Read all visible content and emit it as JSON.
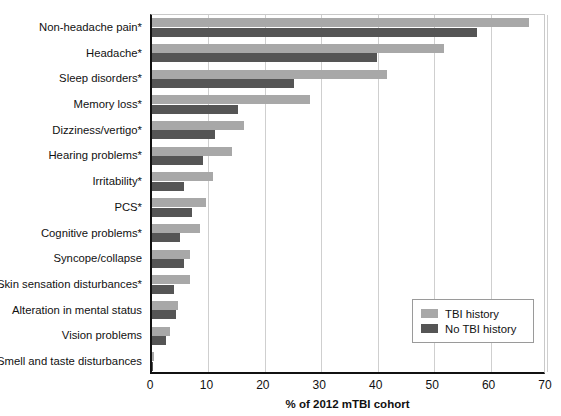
{
  "chart_data": {
    "type": "bar",
    "orientation": "horizontal",
    "title": "",
    "subtitle": "",
    "xlabel": "% of 2012 mTBI cohort",
    "ylabel": "",
    "xlim": [
      0,
      70
    ],
    "xticks": [
      0,
      10,
      20,
      30,
      40,
      50,
      60,
      70
    ],
    "grid": "vertical",
    "legend_position": "inside-bottom-right",
    "categories": [
      "Non-headache pain*",
      "Headache*",
      "Sleep disorders*",
      "Memory loss*",
      "Dizziness/vertigo*",
      "Hearing problems*",
      "Irritability*",
      "PCS*",
      "Cognitive problems*",
      "Syncope/collapse",
      "Skin sensation disturbances*",
      "Alteration in mental status",
      "Vision problems",
      "Smell and taste disturbances"
    ],
    "series": [
      {
        "name": "TBI history",
        "color": "#a8a8a8",
        "values": [
          66.8,
          51.8,
          41.7,
          28.0,
          16.3,
          14.2,
          10.8,
          9.6,
          8.5,
          6.7,
          6.7,
          4.6,
          3.2,
          0.3
        ]
      },
      {
        "name": "No TBI history",
        "color": "#555555",
        "values": [
          57.6,
          39.9,
          25.2,
          15.2,
          11.2,
          9.0,
          5.7,
          7.1,
          5.0,
          5.7,
          3.9,
          4.3,
          2.5,
          0.2
        ]
      }
    ]
  },
  "legend": {
    "items": [
      {
        "label": "TBI history",
        "color": "#a8a8a8"
      },
      {
        "label": "No TBI history",
        "color": "#555555"
      }
    ]
  },
  "axis": {
    "x_title": "% of 2012 mTBI cohort",
    "tick_labels": [
      "0",
      "10",
      "20",
      "30",
      "40",
      "50",
      "60",
      "70"
    ]
  },
  "colors": {
    "tbi_history": "#a8a8a8",
    "no_tbi_history": "#555555",
    "gridline": "#cfcfcf",
    "axis": "#111111",
    "background": "#ffffff"
  }
}
